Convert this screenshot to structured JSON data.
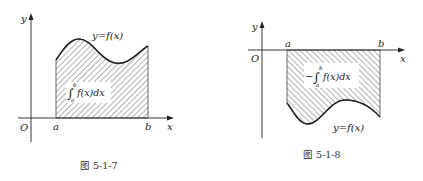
{
  "figures": [
    {
      "id": "fig-5-1-7",
      "caption": "图 5-1-7",
      "axis_x_label": "x",
      "axis_y_label": "y",
      "origin_label": "O",
      "a_label": "a",
      "b_label": "b",
      "curve_label": "y=f(x)",
      "integral_label": "f(x)dx",
      "integral_prefix": "",
      "integral_upper": "b",
      "integral_lower": "a",
      "region": "above x-axis, f(x) > 0"
    },
    {
      "id": "fig-5-1-8",
      "caption": "图 5-1-8",
      "axis_x_label": "x",
      "axis_y_label": "y",
      "origin_label": "O",
      "a_label": "a",
      "b_label": "b",
      "curve_label": "y=f(x)",
      "integral_label": "f(x)dx",
      "integral_prefix": "−",
      "integral_upper": "b",
      "integral_lower": "a",
      "region": "below x-axis, f(x) < 0"
    }
  ],
  "colors": {
    "ink": "#222222",
    "hatch": "#555555",
    "background": "#ffffff"
  }
}
